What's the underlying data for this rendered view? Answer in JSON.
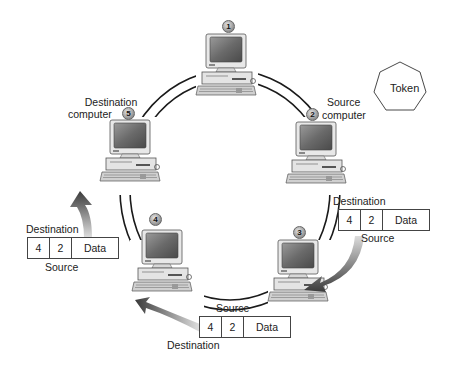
{
  "diagram": {
    "type": "token-ring-network",
    "ring_color": "#1a1a1a",
    "arrow_gradient": [
      "#3a3a3a",
      "#d8d8d8"
    ],
    "token": {
      "label": "Token",
      "shape": "heptagon"
    },
    "computers": [
      {
        "id": 1,
        "badge": "1",
        "label": ""
      },
      {
        "id": 2,
        "badge": "2",
        "label_line1": "Source",
        "label_line2": "computer"
      },
      {
        "id": 3,
        "badge": "3",
        "label": ""
      },
      {
        "id": 4,
        "badge": "4",
        "label": ""
      },
      {
        "id": 5,
        "badge": "5",
        "label_line1": "Destination",
        "label_line2": "computer"
      }
    ],
    "packets": [
      {
        "position": "right",
        "top_label": "Destination",
        "bottom_label": "Source",
        "cells": [
          "4",
          "2",
          "Data"
        ]
      },
      {
        "position": "bottom",
        "top_label": "Source",
        "bottom_label": "Destination",
        "cells": [
          "4",
          "2",
          "Data"
        ]
      },
      {
        "position": "left",
        "top_label": "Destination",
        "bottom_label": "Source",
        "cells": [
          "4",
          "2",
          "Data"
        ]
      }
    ]
  }
}
